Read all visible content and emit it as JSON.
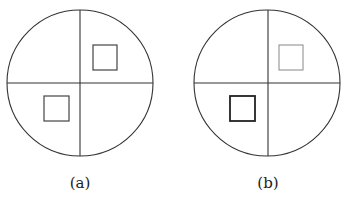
{
  "figure": {
    "panels": [
      {
        "label": "(a)",
        "circle": {
          "cx": 80,
          "cy": 83,
          "r": 73
        },
        "squares": [
          {
            "position": "upper-right",
            "x": 93,
            "y": 45,
            "w": 24,
            "h": 25,
            "stroke": "#444444",
            "stroke_width": 1.2
          },
          {
            "position": "lower-left",
            "x": 44,
            "y": 96,
            "w": 25,
            "h": 25,
            "stroke": "#444444",
            "stroke_width": 1.2
          }
        ]
      },
      {
        "label": "(b)",
        "circle": {
          "cx": 267,
          "cy": 83,
          "r": 73
        },
        "squares": [
          {
            "position": "upper-right",
            "x": 279,
            "y": 45,
            "w": 24,
            "h": 25,
            "stroke": "#888888",
            "stroke_width": 1.0
          },
          {
            "position": "lower-left",
            "x": 230,
            "y": 96,
            "w": 25,
            "h": 25,
            "stroke": "#222222",
            "stroke_width": 1.8
          }
        ]
      }
    ],
    "colors": {
      "line": "#333333",
      "background": "#ffffff"
    }
  }
}
